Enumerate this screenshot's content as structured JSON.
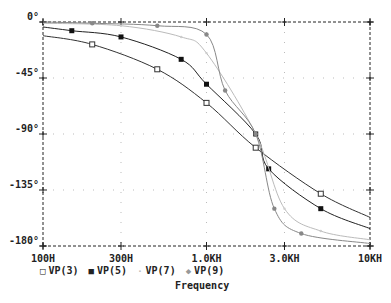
{
  "chart_data": {
    "type": "line",
    "title": "",
    "xlabel": "Frequency",
    "ylabel": "",
    "xscale": "log",
    "xlim": [
      100,
      10000
    ],
    "ylim": [
      -180,
      0
    ],
    "grid": true,
    "legend_position": "bottom",
    "x_ticks": [
      {
        "value": 100,
        "label": "100H"
      },
      {
        "value": 300,
        "label": "300H"
      },
      {
        "value": 1000,
        "label": "1.0KH"
      },
      {
        "value": 3000,
        "label": "3.0KH"
      },
      {
        "value": 10000,
        "label": "10KH"
      }
    ],
    "y_ticks": [
      {
        "value": 0,
        "label": "0°"
      },
      {
        "value": -45,
        "label": "-45°"
      },
      {
        "value": -90,
        "label": "-90°"
      },
      {
        "value": -135,
        "label": "-135°"
      },
      {
        "value": -180,
        "label": "-180°"
      }
    ],
    "series": [
      {
        "name": "VP(3)",
        "marker": "open-square",
        "color": "#333333",
        "x": [
          100,
          200,
          500,
          1000,
          2000,
          5000,
          10000
        ],
        "y": [
          -11,
          -18,
          -38,
          -65,
          -101,
          -138,
          -157
        ]
      },
      {
        "name": "VP(5)",
        "marker": "filled-square",
        "color": "#222222",
        "x": [
          100,
          150,
          300,
          700,
          1000,
          2000,
          2400,
          5000,
          10000
        ],
        "y": [
          -4,
          -7,
          -12,
          -30,
          -50,
          -90,
          -118,
          -150,
          -166
        ]
      },
      {
        "name": "VP(7)",
        "marker": "dot",
        "color": "#bbbbbb",
        "x": [
          100,
          300,
          700,
          1000,
          2000,
          3000,
          5000,
          10000
        ],
        "y": [
          -1,
          -3,
          -12,
          -25,
          -90,
          -150,
          -168,
          -175
        ]
      },
      {
        "name": "VP(9)",
        "marker": "diamond",
        "color": "#888888",
        "x": [
          100,
          200,
          500,
          1000,
          1300,
          2000,
          2600,
          3800,
          10000
        ],
        "y": [
          0,
          -1,
          -3,
          -10,
          -55,
          -90,
          -150,
          -170,
          -178
        ]
      }
    ],
    "legend_entries": [
      "VP(3)",
      "VP(5)",
      "VP(7)",
      "VP(9)"
    ]
  },
  "legend": {
    "items": [
      {
        "marker": "□",
        "label": "VP(3)"
      },
      {
        "marker": "■",
        "label": "VP(5)"
      },
      {
        "marker": "·",
        "label": "VP(7)"
      },
      {
        "marker": "◆",
        "label": "VP(9)"
      }
    ]
  },
  "axis": {
    "xlabel": "Frequency"
  }
}
